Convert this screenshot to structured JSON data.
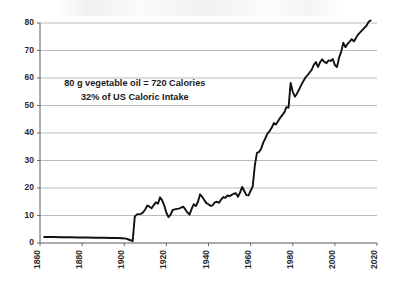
{
  "chart_data": {
    "type": "line",
    "title": "",
    "xlabel": "",
    "ylabel": "",
    "xlim": [
      1860,
      2020
    ],
    "ylim": [
      0,
      80
    ],
    "grid": true,
    "legend": "none",
    "xtick_labels": [
      "1860",
      "1880",
      "1900",
      "1920",
      "1940",
      "1960",
      "1980",
      "2000",
      "2020"
    ],
    "xticks": [
      1860,
      1880,
      1900,
      1920,
      1940,
      1960,
      1980,
      2000,
      2020
    ],
    "ytick_labels": [
      "0",
      "10",
      "20",
      "30",
      "40",
      "50",
      "60",
      "70",
      "80"
    ],
    "yticks": [
      0,
      10,
      20,
      30,
      40,
      50,
      60,
      70,
      80
    ],
    "annotations": [
      {
        "text": "80 g vegetable oil = 720 Calories",
        "x": 1905,
        "y": 57
      },
      {
        "text": "32% of US Caloric Intake",
        "x": 1905,
        "y": 52
      }
    ],
    "line_color": "#111111",
    "grid_color": "#a8a8a8",
    "series": [
      {
        "name": "vegetable oil consumption",
        "x": [
          1862,
          1866,
          1870,
          1874,
          1878,
          1882,
          1886,
          1890,
          1894,
          1897,
          1899,
          1901,
          1903,
          1904,
          1905,
          1906,
          1907,
          1908,
          1909,
          1910,
          1911,
          1912,
          1913,
          1914,
          1915,
          1916,
          1917,
          1918,
          1919,
          1920,
          1921,
          1922,
          1923,
          1924,
          1925,
          1926,
          1927,
          1928,
          1929,
          1930,
          1931,
          1932,
          1933,
          1934,
          1935,
          1936,
          1937,
          1938,
          1939,
          1940,
          1941,
          1942,
          1943,
          1944,
          1945,
          1946,
          1947,
          1948,
          1949,
          1950,
          1951,
          1952,
          1953,
          1954,
          1955,
          1956,
          1957,
          1958,
          1959,
          1960,
          1961,
          1962,
          1963,
          1964,
          1965,
          1966,
          1967,
          1968,
          1969,
          1970,
          1971,
          1972,
          1973,
          1974,
          1975,
          1976,
          1977,
          1978,
          1979,
          1980,
          1981,
          1982,
          1983,
          1984,
          1985,
          1986,
          1987,
          1988,
          1989,
          1990,
          1991,
          1992,
          1993,
          1994,
          1995,
          1996,
          1997,
          1998,
          1999,
          2000,
          2001,
          2002,
          2003,
          2004,
          2005,
          2006,
          2007,
          2008,
          2009,
          2010,
          2011,
          2012,
          2013,
          2014,
          2015,
          2016,
          2017
        ],
        "values": [
          2.2,
          2.2,
          2.1,
          2.1,
          2.0,
          2.0,
          1.9,
          1.9,
          1.8,
          1.8,
          1.7,
          1.6,
          1.0,
          0.7,
          9.6,
          10.4,
          10.5,
          10.6,
          11.2,
          12.3,
          13.6,
          13.2,
          12.6,
          13.8,
          14.8,
          14.3,
          16.6,
          15.5,
          13.6,
          11.0,
          9.4,
          10.3,
          12.0,
          12.2,
          12.4,
          12.5,
          12.9,
          13.2,
          12.2,
          11.1,
          10.3,
          12.4,
          14.1,
          13.4,
          15.0,
          17.7,
          16.8,
          15.6,
          14.5,
          14.1,
          13.5,
          13.7,
          14.8,
          15.0,
          14.6,
          15.8,
          16.7,
          16.4,
          17.3,
          17.0,
          17.5,
          17.9,
          18.1,
          16.8,
          18.4,
          20.4,
          18.9,
          17.4,
          17.3,
          19.0,
          20.6,
          28.2,
          32.8,
          33.1,
          34.3,
          36.5,
          38.1,
          39.8,
          40.7,
          41.9,
          43.6,
          43.1,
          44.3,
          45.5,
          46.5,
          47.5,
          49.4,
          49.2,
          58.2,
          55.0,
          53.2,
          54.3,
          55.8,
          57.4,
          58.8,
          60.1,
          61.0,
          62.0,
          63.0,
          64.8,
          65.8,
          64.0,
          65.8,
          66.8,
          65.9,
          65.4,
          66.4,
          66.2,
          66.9,
          64.7,
          64.0,
          67.4,
          69.5,
          72.8,
          71.2,
          72.4,
          73.2,
          74.1,
          73.3,
          74.5,
          75.8,
          76.6,
          77.4,
          78.2,
          79.0,
          80.4,
          80.9
        ]
      }
    ]
  }
}
